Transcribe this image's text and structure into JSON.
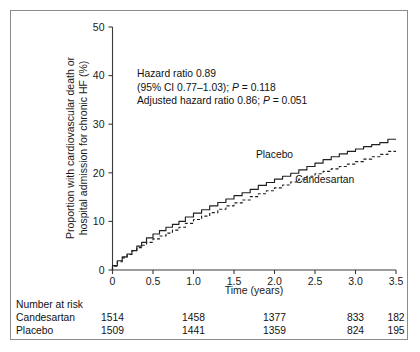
{
  "chart_data": {
    "type": "line",
    "title": "",
    "xlabel": "Time (years)",
    "ylabel": "Proportion with cardiovascular death or hospital admission for chronic HF (%)",
    "ylabel_line1": "Proportion with cardiovascular death or",
    "ylabel_line2": "hospital admission for chronic HF (%)",
    "xlim": [
      0,
      3.5
    ],
    "ylim": [
      0,
      50
    ],
    "xticks": [
      "0",
      "0.5",
      "1.0",
      "1.5",
      "2.0",
      "2.5",
      "3.0",
      "3.5"
    ],
    "xtick_values": [
      0,
      0.5,
      1.0,
      1.5,
      2.0,
      2.5,
      3.0,
      3.5
    ],
    "yticks": [
      "0",
      "10",
      "20",
      "30",
      "40",
      "50"
    ],
    "ytick_values": [
      0,
      10,
      20,
      30,
      40,
      50
    ],
    "grid": false,
    "legend_position": "inline-labels",
    "series": [
      {
        "name": "Placebo",
        "style": "solid",
        "label_x": 2.0,
        "label_y": 23.0,
        "x": [
          0,
          0.06,
          0.12,
          0.18,
          0.24,
          0.3,
          0.36,
          0.42,
          0.5,
          0.58,
          0.66,
          0.74,
          0.82,
          0.9,
          1.0,
          1.1,
          1.2,
          1.3,
          1.4,
          1.5,
          1.6,
          1.7,
          1.8,
          1.9,
          2.0,
          2.1,
          2.2,
          2.3,
          2.4,
          2.5,
          2.6,
          2.7,
          2.8,
          2.9,
          3.0,
          3.1,
          3.2,
          3.3,
          3.4,
          3.5
        ],
        "y": [
          0,
          0.9,
          1.9,
          2.7,
          3.3,
          4.0,
          4.9,
          5.7,
          6.6,
          7.4,
          8.1,
          8.8,
          9.4,
          10.0,
          10.9,
          11.7,
          12.4,
          13.2,
          13.9,
          14.6,
          15.3,
          15.9,
          16.6,
          17.4,
          18.0,
          18.7,
          19.3,
          19.9,
          20.6,
          21.3,
          22.0,
          22.7,
          23.3,
          23.9,
          24.4,
          24.9,
          25.4,
          25.8,
          26.2,
          26.9
        ]
      },
      {
        "name": "Candesartan",
        "style": "dashed",
        "label_x": 2.62,
        "label_y": 18.0,
        "x": [
          0,
          0.06,
          0.12,
          0.18,
          0.24,
          0.3,
          0.36,
          0.42,
          0.5,
          0.58,
          0.66,
          0.74,
          0.82,
          0.9,
          1.0,
          1.1,
          1.2,
          1.3,
          1.4,
          1.5,
          1.6,
          1.7,
          1.8,
          1.9,
          2.0,
          2.1,
          2.2,
          2.3,
          2.4,
          2.5,
          2.6,
          2.7,
          2.8,
          2.9,
          3.0,
          3.1,
          3.2,
          3.3,
          3.4,
          3.5
        ],
        "y": [
          0,
          0.8,
          1.7,
          2.5,
          3.2,
          4.0,
          4.6,
          5.1,
          5.7,
          6.4,
          7.0,
          7.6,
          8.2,
          8.8,
          9.6,
          10.4,
          11.1,
          11.8,
          12.5,
          13.2,
          13.8,
          14.4,
          15.1,
          15.7,
          16.3,
          16.9,
          17.5,
          18.1,
          18.7,
          19.3,
          19.8,
          20.3,
          20.8,
          21.3,
          21.8,
          22.3,
          22.8,
          23.3,
          23.8,
          24.4
        ]
      }
    ],
    "annotations": [
      {
        "text": "Hazard ratio 0.89"
      },
      {
        "text": "(95% CI 0.77–1.03); P = 0.118"
      },
      {
        "text": "Adjusted hazard ratio 0.86; P = 0.051"
      }
    ]
  },
  "annotation": {
    "line1": "Hazard ratio 0.89",
    "line2_a": "(95% CI 0.77–1.03); ",
    "line2_p": "P",
    "line2_b": " = 0.118",
    "line3_a": "Adjusted hazard ratio 0.86; ",
    "line3_p": "P",
    "line3_b": " = 0.051"
  },
  "risk_table": {
    "title": "Number at risk",
    "tick_positions": [
      0,
      1.0,
      2.0,
      3.0,
      3.5
    ],
    "rows": [
      {
        "label": "Candesartan",
        "values": [
          "1514",
          "1458",
          "1377",
          "833",
          "182"
        ]
      },
      {
        "label": "Placebo",
        "values": [
          "1509",
          "1441",
          "1359",
          "824",
          "195"
        ]
      }
    ]
  }
}
